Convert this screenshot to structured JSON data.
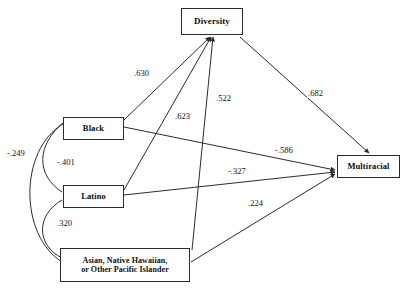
{
  "figure": {
    "type": "path-diagram",
    "background_color": "#ffffff",
    "line_color": "#2b2b2b",
    "text_color": "#111111"
  },
  "nodes": [
    {
      "id": "diversity",
      "label": "Diversity",
      "x": 181,
      "y": 8,
      "w": 62,
      "h": 27,
      "font_size": 9
    },
    {
      "id": "black",
      "label": "Black",
      "x": 63,
      "y": 117,
      "w": 61,
      "h": 23,
      "font_size": 8.5
    },
    {
      "id": "latino",
      "label": "Latino",
      "x": 63,
      "y": 185,
      "w": 61,
      "h": 23,
      "font_size": 8.5
    },
    {
      "id": "asian_nhpi",
      "label": "Asian, Native Hawaiian,\nor Other Pacific Islander",
      "x": 60,
      "y": 248,
      "w": 130,
      "h": 34,
      "font_size": 8
    },
    {
      "id": "multiracial",
      "label": "Multiracial",
      "x": 337,
      "y": 155,
      "w": 63,
      "h": 23,
      "font_size": 8.5
    }
  ],
  "edges": [
    {
      "id": "black-diversity",
      "from": "black",
      "to": "diversity",
      "coefficient": ".630",
      "label_x": 133,
      "label_y": 69,
      "kind": "directed"
    },
    {
      "id": "latino-diversity",
      "from": "latino",
      "to": "diversity",
      "coefficient": ".623",
      "label_x": 174,
      "label_y": 112,
      "kind": "directed"
    },
    {
      "id": "asian-diversity",
      "from": "asian_nhpi",
      "to": "diversity",
      "coefficient": ".522",
      "label_x": 215,
      "label_y": 94,
      "kind": "directed"
    },
    {
      "id": "diversity-multiracial",
      "from": "diversity",
      "to": "multiracial",
      "coefficient": ".682",
      "label_x": 307,
      "label_y": 89,
      "kind": "directed"
    },
    {
      "id": "black-multiracial",
      "from": "black",
      "to": "multiracial",
      "coefficient": "-.586",
      "label_x": 274,
      "label_y": 146,
      "kind": "directed"
    },
    {
      "id": "latino-multiracial",
      "from": "latino",
      "to": "multiracial",
      "coefficient": "-.327",
      "label_x": 227,
      "label_y": 167,
      "kind": "directed"
    },
    {
      "id": "asian-multiracial",
      "from": "asian_nhpi",
      "to": "multiracial",
      "coefficient": ".224",
      "label_x": 247,
      "label_y": 199,
      "kind": "directed"
    }
  ],
  "correlations": [
    {
      "id": "black-asian-corr",
      "between": [
        "black",
        "asian_nhpi"
      ],
      "coefficient": "-.249",
      "label_x": 6,
      "label_y": 149,
      "kind": "curved"
    },
    {
      "id": "black-latino-corr",
      "between": [
        "black",
        "latino"
      ],
      "coefficient": "-.401",
      "label_x": 56,
      "label_y": 158,
      "kind": "curved"
    },
    {
      "id": "latino-asian-corr",
      "between": [
        "latino",
        "asian_nhpi"
      ],
      "coefficient": ".320",
      "label_x": 56,
      "label_y": 219,
      "kind": "curved"
    }
  ]
}
